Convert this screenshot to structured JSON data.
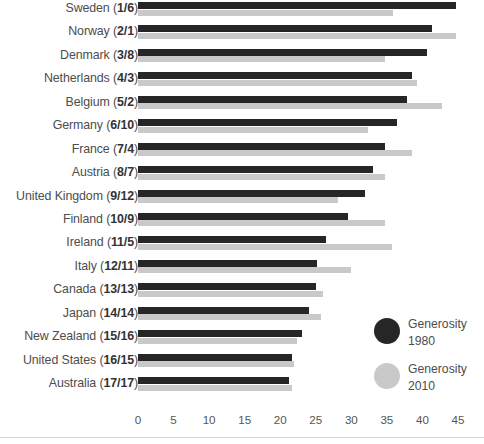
{
  "chart_data": {
    "type": "bar",
    "orientation": "horizontal",
    "title": "",
    "xlabel": "",
    "ylabel": "",
    "xlim": [
      0,
      45
    ],
    "xticks": [
      0,
      5,
      10,
      15,
      20,
      25,
      30,
      35,
      40,
      45
    ],
    "grid": false,
    "legend_position": "inside-right",
    "categories": [
      "Sweden (1/6)",
      "Norway (2/1)",
      "Denmark (3/8)",
      "Netherlands (4/3)",
      "Belgium (5/2)",
      "Germany (6/10)",
      "France (7/4)",
      "Austria (8/7)",
      "United Kingdom (9/12)",
      "Finland (10/9)",
      "Ireland (11/5)",
      "Italy (12/11)",
      "Canada (13/13)",
      "Japan (14/14)",
      "New Zealand (15/16)",
      "United States (16/15)",
      "Australia (17/17)"
    ],
    "category_parts": [
      {
        "name": "Sweden",
        "ranks": "1/6"
      },
      {
        "name": "Norway",
        "ranks": "2/1"
      },
      {
        "name": "Denmark",
        "ranks": "3/8"
      },
      {
        "name": "Netherlands",
        "ranks": "4/3"
      },
      {
        "name": "Belgium",
        "ranks": "5/2"
      },
      {
        "name": "Germany",
        "ranks": "6/10"
      },
      {
        "name": "France",
        "ranks": "7/4"
      },
      {
        "name": "Austria",
        "ranks": "8/7"
      },
      {
        "name": "United Kingdom",
        "ranks": "9/12"
      },
      {
        "name": "Finland",
        "ranks": "10/9"
      },
      {
        "name": "Ireland",
        "ranks": "11/5"
      },
      {
        "name": "Italy",
        "ranks": "12/11"
      },
      {
        "name": "Canada",
        "ranks": "13/13"
      },
      {
        "name": "Japan",
        "ranks": "14/14"
      },
      {
        "name": "New Zealand",
        "ranks": "15/16"
      },
      {
        "name": "United States",
        "ranks": "16/15"
      },
      {
        "name": "Australia",
        "ranks": "17/17"
      }
    ],
    "series": [
      {
        "name": "Generosity 1980",
        "color": "#262626",
        "values": [
          44.7,
          41.3,
          40.6,
          38.6,
          37.8,
          36.4,
          34.8,
          33.0,
          31.9,
          29.5,
          26.4,
          25.2,
          25.1,
          24.0,
          23.0,
          21.7,
          21.2
        ]
      },
      {
        "name": "Generosity 2010",
        "color": "#c9c9c9",
        "values": [
          35.8,
          44.7,
          34.7,
          39.3,
          42.7,
          32.4,
          38.6,
          34.8,
          28.1,
          34.7,
          35.7,
          30.0,
          26.0,
          25.7,
          22.3,
          22.0,
          21.6
        ]
      }
    ]
  },
  "legend": {
    "items": [
      {
        "label_line1": "Generosity",
        "label_line2": "1980",
        "color": "#262626"
      },
      {
        "label_line1": "Generosity",
        "label_line2": "2010",
        "color": "#c9c9c9"
      }
    ]
  }
}
